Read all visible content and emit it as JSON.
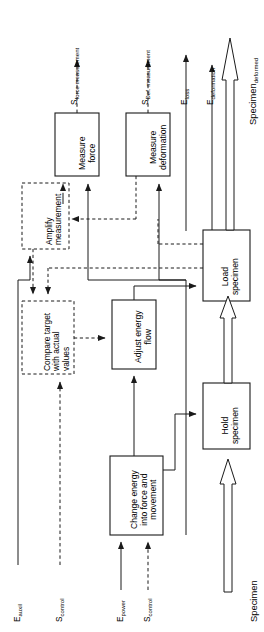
{
  "figure": {
    "type": "block-diagram",
    "orientation": "rotated-90-ccw",
    "colors": {
      "stroke": "#1a1a1a",
      "background": "#ffffff",
      "dashed_stroke": "#1a1a1a"
    }
  },
  "blocks": [
    {
      "id": "measure-force",
      "label_lines": [
        "Measure",
        "force"
      ],
      "style": "solid",
      "group": "measurement"
    },
    {
      "id": "measure-deformation",
      "label_lines": [
        "Measure",
        "deformation"
      ],
      "style": "solid",
      "group": "measurement"
    },
    {
      "id": "amplify-measurement",
      "label_lines": [
        "Amplify",
        "measurement"
      ],
      "style": "dashed",
      "group": "control"
    },
    {
      "id": "compare-target",
      "label_lines": [
        "Compare target",
        "with actual",
        "values"
      ],
      "style": "dashed",
      "group": "control"
    },
    {
      "id": "adjust-energy-flow",
      "label_lines": [
        "Adjust energy",
        "flow"
      ],
      "style": "solid",
      "group": "energy"
    },
    {
      "id": "change-energy",
      "label_lines": [
        "Change energy",
        "into force and",
        "movement"
      ],
      "style": "solid",
      "group": "energy"
    },
    {
      "id": "load-specimen",
      "label_lines": [
        "Load",
        "specimen"
      ],
      "style": "solid",
      "group": "specimen"
    },
    {
      "id": "hold-specimen",
      "label_lines": [
        "Hold",
        "specimen"
      ],
      "style": "solid",
      "group": "specimen"
    }
  ],
  "io_labels": [
    {
      "id": "s-force-measurement",
      "base": "S",
      "sub": "force measurement",
      "flow": "signal",
      "direction": "output"
    },
    {
      "id": "s-def-measurement",
      "base": "S",
      "sub": "Def. measurement",
      "flow": "signal",
      "direction": "output"
    },
    {
      "id": "e-loss",
      "base": "E",
      "sub": "loss",
      "flow": "energy",
      "direction": "output"
    },
    {
      "id": "e-deformation",
      "base": "E",
      "sub": "deformation",
      "flow": "energy",
      "direction": "output"
    },
    {
      "id": "specimen-deformed",
      "base": "Specimen",
      "sub": "deformed",
      "flow": "material",
      "direction": "output"
    },
    {
      "id": "e-auxil",
      "base": "E",
      "sub": "auxil",
      "flow": "energy",
      "direction": "input"
    },
    {
      "id": "s-control-left",
      "base": "S",
      "sub": "control",
      "flow": "signal",
      "direction": "input"
    },
    {
      "id": "e-power",
      "base": "E",
      "sub": "power",
      "flow": "energy",
      "direction": "input"
    },
    {
      "id": "s-control-bottom",
      "base": "S",
      "sub": "control",
      "flow": "signal",
      "direction": "input"
    },
    {
      "id": "specimen",
      "base": "Specimen",
      "sub": "",
      "flow": "material",
      "direction": "input"
    }
  ]
}
